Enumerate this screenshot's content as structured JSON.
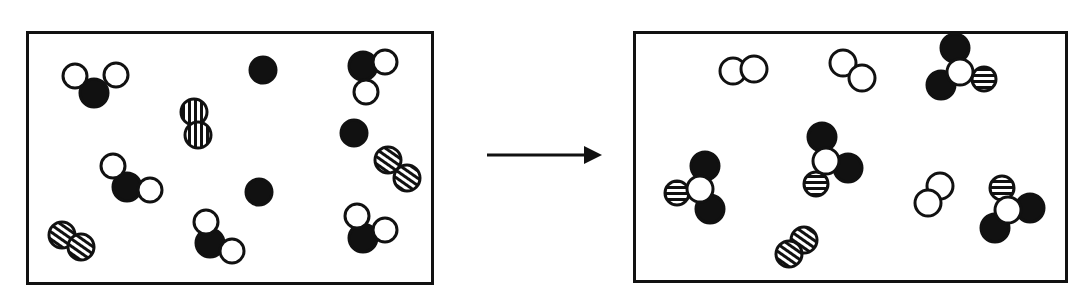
{
  "figure": {
    "type": "before-after particle diagram",
    "background_color": "#ffffff",
    "line_color": "#111111"
  },
  "atom_types": {
    "black": {
      "name": "black-atom",
      "fill": "#111111",
      "stroke": "#111111"
    },
    "white": {
      "name": "white-atom",
      "fill": "#ffffff",
      "stroke": "#111111"
    },
    "striped": {
      "name": "striped-atom",
      "fill": "#ffffff",
      "stroke": "#111111",
      "pattern": "horizontal-stripes"
    }
  },
  "arrow": {
    "name": "reaction-arrow",
    "direction": "right",
    "x1": 487,
    "y1": 155,
    "x2": 600,
    "y2": 155
  },
  "left_box": {
    "name": "reactants-box",
    "x": 26,
    "y": 31,
    "width": 408,
    "height": 254,
    "counts": {
      "bent_black_center_molecules": 4,
      "striped_diatomic_molecules": 4,
      "lone_black_atoms": 3
    },
    "molecules": [
      {
        "id": "L1",
        "kind": "bent-AB2",
        "center": {
          "type": "black",
          "cx": 94,
          "cy": 93,
          "r": 14
        },
        "atoms": [
          {
            "type": "white",
            "cx": 75,
            "cy": 76,
            "r": 12
          },
          {
            "type": "white",
            "cx": 116,
            "cy": 75,
            "r": 12
          }
        ]
      },
      {
        "id": "L2",
        "kind": "striped-diatomic",
        "orientation": "vertical",
        "atoms": [
          {
            "type": "striped",
            "cx": 194,
            "cy": 112,
            "r": 13
          },
          {
            "type": "striped",
            "cx": 198,
            "cy": 135,
            "r": 13
          }
        ]
      },
      {
        "id": "L3",
        "kind": "lone-atom",
        "atoms": [
          {
            "type": "black",
            "cx": 263,
            "cy": 70,
            "r": 13
          }
        ]
      },
      {
        "id": "L4",
        "kind": "bent-AB2",
        "center": {
          "type": "black",
          "cx": 363,
          "cy": 66,
          "r": 14
        },
        "atoms": [
          {
            "type": "white",
            "cx": 385,
            "cy": 62,
            "r": 12
          },
          {
            "type": "white",
            "cx": 366,
            "cy": 92,
            "r": 12
          }
        ]
      },
      {
        "id": "L5",
        "kind": "lone-atom",
        "atoms": [
          {
            "type": "black",
            "cx": 354,
            "cy": 133,
            "r": 13
          }
        ]
      },
      {
        "id": "L6",
        "kind": "bent-AB2",
        "center": {
          "type": "black",
          "cx": 127,
          "cy": 187,
          "r": 14
        },
        "atoms": [
          {
            "type": "white",
            "cx": 113,
            "cy": 166,
            "r": 12
          },
          {
            "type": "white",
            "cx": 150,
            "cy": 190,
            "r": 12
          }
        ]
      },
      {
        "id": "L7",
        "kind": "striped-diatomic",
        "orientation": "diagonal",
        "atoms": [
          {
            "type": "striped",
            "cx": 388,
            "cy": 160,
            "r": 13
          },
          {
            "type": "striped",
            "cx": 407,
            "cy": 178,
            "r": 13
          }
        ]
      },
      {
        "id": "L8",
        "kind": "lone-atom",
        "atoms": [
          {
            "type": "black",
            "cx": 259,
            "cy": 192,
            "r": 13
          }
        ]
      },
      {
        "id": "L9",
        "kind": "striped-diatomic",
        "orientation": "diagonal",
        "atoms": [
          {
            "type": "striped",
            "cx": 62,
            "cy": 235,
            "r": 13
          },
          {
            "type": "striped",
            "cx": 81,
            "cy": 247,
            "r": 13
          }
        ]
      },
      {
        "id": "L10",
        "kind": "bent-AB2",
        "center": {
          "type": "black",
          "cx": 210,
          "cy": 243,
          "r": 14
        },
        "atoms": [
          {
            "type": "white",
            "cx": 206,
            "cy": 222,
            "r": 12
          },
          {
            "type": "white",
            "cx": 232,
            "cy": 251,
            "r": 12
          }
        ]
      },
      {
        "id": "L11",
        "kind": "bent-AB2",
        "center": {
          "type": "black",
          "cx": 363,
          "cy": 238,
          "r": 14
        },
        "atoms": [
          {
            "type": "white",
            "cx": 357,
            "cy": 216,
            "r": 12
          },
          {
            "type": "white",
            "cx": 385,
            "cy": 230,
            "r": 12
          }
        ]
      }
    ]
  },
  "right_box": {
    "name": "products-box",
    "x": 633,
    "y": 31,
    "width": 435,
    "height": 252,
    "counts": {
      "tetrahedral_molecules": 4,
      "white_diatomic_molecules": 3,
      "striped_diatomic_molecules": 1
    },
    "molecules": [
      {
        "id": "R1",
        "kind": "white-diatomic",
        "orientation": "horizontal",
        "atoms": [
          {
            "type": "white",
            "cx": 733,
            "cy": 71,
            "r": 13
          },
          {
            "type": "white",
            "cx": 754,
            "cy": 69,
            "r": 13
          }
        ]
      },
      {
        "id": "R2",
        "kind": "white-diatomic",
        "orientation": "diagonal",
        "atoms": [
          {
            "type": "white",
            "cx": 843,
            "cy": 63,
            "r": 13
          },
          {
            "type": "white",
            "cx": 862,
            "cy": 78,
            "r": 13
          }
        ]
      },
      {
        "id": "R3",
        "kind": "tetrahedral-AB2C",
        "center": {
          "type": "white",
          "cx": 960,
          "cy": 72,
          "r": 13
        },
        "atoms": [
          {
            "type": "black",
            "cx": 955,
            "cy": 48,
            "r": 14
          },
          {
            "type": "black",
            "cx": 941,
            "cy": 85,
            "r": 14
          },
          {
            "type": "striped",
            "cx": 984,
            "cy": 79,
            "r": 12
          }
        ]
      },
      {
        "id": "R4",
        "kind": "tetrahedral-AB2C",
        "center": {
          "type": "white",
          "cx": 826,
          "cy": 161,
          "r": 13
        },
        "atoms": [
          {
            "type": "black",
            "cx": 822,
            "cy": 137,
            "r": 14
          },
          {
            "type": "black",
            "cx": 848,
            "cy": 168,
            "r": 14
          },
          {
            "type": "striped",
            "cx": 816,
            "cy": 184,
            "r": 12
          }
        ]
      },
      {
        "id": "R5",
        "kind": "tetrahedral-AB2C",
        "center": {
          "type": "white",
          "cx": 700,
          "cy": 189,
          "r": 13
        },
        "atoms": [
          {
            "type": "black",
            "cx": 705,
            "cy": 166,
            "r": 14
          },
          {
            "type": "black",
            "cx": 710,
            "cy": 209,
            "r": 14
          },
          {
            "type": "striped",
            "cx": 677,
            "cy": 193,
            "r": 12
          }
        ]
      },
      {
        "id": "R6",
        "kind": "white-diatomic",
        "orientation": "diagonal",
        "atoms": [
          {
            "type": "white",
            "cx": 940,
            "cy": 186,
            "r": 13
          },
          {
            "type": "white",
            "cx": 928,
            "cy": 203,
            "r": 13
          }
        ]
      },
      {
        "id": "R7",
        "kind": "tetrahedral-AB2C",
        "center": {
          "type": "white",
          "cx": 1008,
          "cy": 210,
          "r": 13
        },
        "atoms": [
          {
            "type": "striped",
            "cx": 1002,
            "cy": 188,
            "r": 12
          },
          {
            "type": "black",
            "cx": 1030,
            "cy": 208,
            "r": 14
          },
          {
            "type": "black",
            "cx": 995,
            "cy": 228,
            "r": 14
          }
        ]
      },
      {
        "id": "R8",
        "kind": "striped-diatomic",
        "orientation": "diagonal",
        "atoms": [
          {
            "type": "striped",
            "cx": 804,
            "cy": 240,
            "r": 13
          },
          {
            "type": "striped",
            "cx": 789,
            "cy": 254,
            "r": 13
          }
        ]
      }
    ]
  }
}
